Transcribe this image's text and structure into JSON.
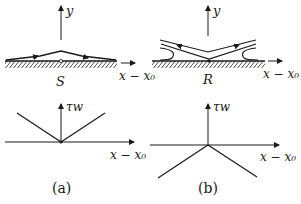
{
  "panels": {
    "a": {
      "caption": "(a)",
      "flow": {
        "point_label": "S",
        "y_axis": "y",
        "x_axis": "x − x₀"
      },
      "shear": {
        "y_axis": "τw",
        "x_axis": "x − x₀",
        "shape": "V (wall shear zero at point, positive on both sides)"
      }
    },
    "b": {
      "caption": "(b)",
      "flow": {
        "point_label": "R",
        "y_axis": "y",
        "x_axis": "x − x₀"
      },
      "shear": {
        "y_axis": "τw",
        "x_axis": "x − x₀",
        "shape": "inverted V (wall shear zero at point, negative on both sides)"
      }
    }
  },
  "colors": {
    "ink": "#1a1a1a",
    "background": "#ffffff"
  }
}
